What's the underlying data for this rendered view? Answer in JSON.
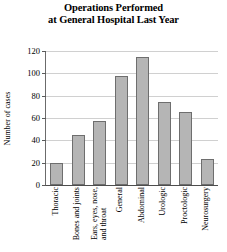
{
  "chart_data": {
    "type": "bar",
    "title": "Operations Performed at General Hospital Last Year",
    "title_line1": "Operations Performed",
    "title_line2": "at General Hospital Last Year",
    "xlabel": "",
    "ylabel": "Number of cases",
    "ylim": [
      0,
      120
    ],
    "yticks": [
      0,
      20,
      40,
      60,
      80,
      100,
      120
    ],
    "grid": true,
    "legend": "none",
    "bar_color": "#b5b5b5",
    "bar_edge_color": "#6e6e6e",
    "categories": [
      "Thoracic",
      "Bones and joints",
      "Ears, eyes, nose, and throat",
      "General",
      "Abdominal",
      "Urologic",
      "Proctologic",
      "Neurosurgery"
    ],
    "category_lines": [
      [
        "Thoracic"
      ],
      [
        "Bones and joints"
      ],
      [
        "Ears, eyes, nose,",
        "and throat"
      ],
      [
        "General"
      ],
      [
        "Abdominal"
      ],
      [
        "Urologic"
      ],
      [
        "Proctologic"
      ],
      [
        "Neurosurgery"
      ]
    ],
    "values": [
      20,
      45,
      57,
      98,
      115,
      74,
      65,
      23
    ]
  }
}
